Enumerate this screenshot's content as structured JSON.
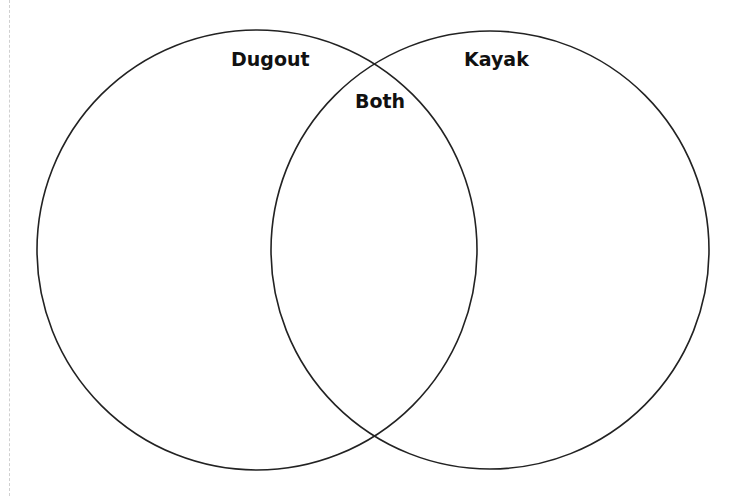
{
  "diagram": {
    "type": "venn",
    "sets": [
      {
        "id": "left",
        "label": "Dugout"
      },
      {
        "id": "right",
        "label": "Kayak"
      }
    ],
    "intersection": {
      "label": "Both"
    },
    "stroke_color": "#222222",
    "background_color": "#ffffff"
  }
}
